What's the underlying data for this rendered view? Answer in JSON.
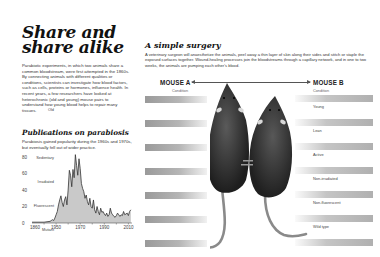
{
  "left": {
    "title_line1": "Share and",
    "title_line2": "share alike",
    "intro": "Parabiotic experiments, in which two animals share a common bloodstream, were first attempted in the 1860s. By connecting animals with different qualities or conditions, scientists can investigate how blood factors, such as cells, proteins or hormones, influence health. In recent years, a few researchers have looked at heterochronic (old and young) mouse pairs to understand how young blood helps to repair many tissues.",
    "publications_title": "Publications on parabiosis",
    "publications_subtitle": "Parabiosis gained popularity during the 1960s and 1970s, but eventually fell out of wider practice."
  },
  "chart_data": {
    "type": "area",
    "title": "Publications on parabiosis",
    "xlabel": "",
    "ylabel": "",
    "x_ticks": [
      1860,
      1950,
      1970,
      1990,
      2010
    ],
    "y_ticks": [
      0,
      20,
      40,
      60,
      80
    ],
    "ylim": [
      0,
      85
    ],
    "xlim": [
      1930,
      2013
    ],
    "grid": false,
    "x": [
      1930,
      1935,
      1940,
      1945,
      1946,
      1947,
      1948,
      1949,
      1950,
      1951,
      1952,
      1953,
      1954,
      1955,
      1956,
      1957,
      1958,
      1959,
      1960,
      1961,
      1962,
      1963,
      1964,
      1965,
      1966,
      1967,
      1968,
      1969,
      1970,
      1971,
      1972,
      1973,
      1974,
      1975,
      1976,
      1977,
      1978,
      1979,
      1980,
      1981,
      1982,
      1983,
      1984,
      1985,
      1986,
      1987,
      1988,
      1989,
      1990,
      1991,
      1992,
      1993,
      1994,
      1995,
      1996,
      1997,
      1998,
      1999,
      2000,
      2001,
      2002,
      2003,
      2004,
      2005,
      2006,
      2007,
      2008,
      2009,
      2010,
      2011,
      2012
    ],
    "values": [
      1,
      1,
      1,
      2,
      3,
      4,
      3,
      6,
      10,
      14,
      22,
      28,
      33,
      25,
      20,
      28,
      32,
      22,
      40,
      64,
      58,
      44,
      65,
      55,
      83,
      70,
      58,
      78,
      66,
      48,
      42,
      38,
      30,
      34,
      26,
      22,
      30,
      20,
      18,
      28,
      16,
      12,
      20,
      14,
      10,
      18,
      13,
      14,
      11,
      9,
      12,
      8,
      10,
      18,
      12,
      10,
      8,
      7,
      9,
      12,
      10,
      8,
      10,
      9,
      14,
      10,
      11,
      12,
      9,
      14,
      16
    ]
  },
  "right": {
    "title": "A simple surgery",
    "description": "A veterinary surgeon will anaesthetize the animals, peel away a thin layer of skin along their sides and stitch or staple the exposed surfaces together. Wound-healing processes join the bloodstreams through a capillary network, and in one to two weeks, the animals are pumping each other's blood.",
    "mouse_a_label": "MOUSE A",
    "mouse_b_label": "MOUSE B",
    "condition_header": "Condition",
    "mouse_a_conditions": [
      "Old",
      "Obese",
      "Sedentary",
      "Irradiated",
      "Fluorescent",
      "Mutant"
    ],
    "mouse_b_conditions": [
      "Young",
      "Lean",
      "Active",
      "Non-irradiated",
      "Non-fluorescent",
      "Wild type"
    ]
  }
}
